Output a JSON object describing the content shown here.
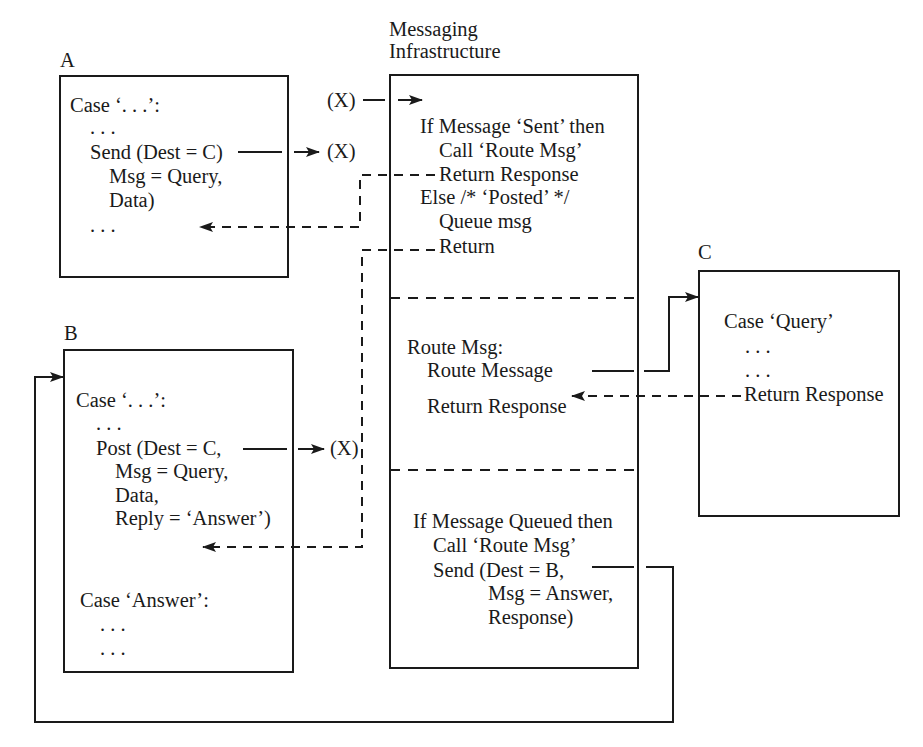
{
  "diagram": {
    "labels": {
      "a": "A",
      "b": "B",
      "c": "C",
      "messaging_line1": "Messaging",
      "messaging_line2": "Infrastructure"
    },
    "box_a": {
      "lines": [
        "Case ‘. . .’:",
        ". . .",
        "Send (Dest = C)",
        "Msg = Query,",
        "Data)",
        ". . ."
      ]
    },
    "box_b": {
      "lines": [
        "Case ‘. . .’:",
        ". . .",
        "Post (Dest = C,",
        "Msg = Query,",
        "Data,",
        "Reply = ‘Answer’)",
        "Case ‘Answer’:",
        ". . .",
        ". . ."
      ]
    },
    "box_c": {
      "lines": [
        "Case ‘Query’",
        ". . .",
        ". . .",
        "Return Response"
      ]
    },
    "messaging": {
      "section1": [
        "If Message ‘Sent’ then",
        "Call ‘Route Msg’",
        "Return Response",
        "Else /* ‘Posted’ */",
        "Queue msg",
        "Return"
      ],
      "section2": [
        "Route Msg:",
        "Route Message",
        "Return Response"
      ],
      "section3": [
        "If Message Queued then",
        "Call ‘Route Msg’",
        "Send (Dest = B,",
        "Msg = Answer,",
        "Response)"
      ]
    },
    "entry_points": {
      "x_top": "(X)",
      "x_from_a": "(X)",
      "x_from_b": "(X)"
    },
    "colors": {
      "ink": "#1a1a1a",
      "background": "#ffffff"
    }
  }
}
